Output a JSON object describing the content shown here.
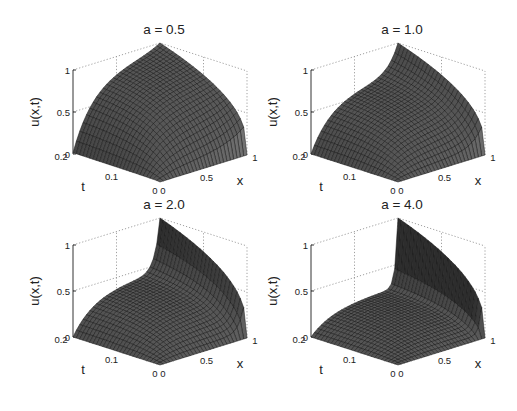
{
  "chart_data": [
    {
      "type": "surface",
      "title": "a = 0.5",
      "a": 0.5,
      "xlabel": "x",
      "ylabel": "t",
      "zlabel": "u(x,t)",
      "x_ticks": [
        "0",
        "0.5",
        "1"
      ],
      "t_ticks": [
        "0",
        "0.1",
        "0.2"
      ],
      "z_ticks": [
        "0",
        "0.5",
        "1"
      ],
      "xlim": [
        0,
        1
      ],
      "tlim": [
        0,
        0.2
      ],
      "zlim": [
        0,
        1
      ],
      "grid": true,
      "plateau_at_t_max": 0.85,
      "peak_at_x1": 1.0
    },
    {
      "type": "surface",
      "title": "a = 1.0",
      "a": 1.0,
      "xlabel": "x",
      "ylabel": "t",
      "zlabel": "u(x,t)",
      "x_ticks": [
        "0",
        "0.5",
        "1"
      ],
      "t_ticks": [
        "0",
        "0.1",
        "0.2"
      ],
      "z_ticks": [
        "0",
        "0.5",
        "1"
      ],
      "xlim": [
        0,
        1
      ],
      "tlim": [
        0,
        0.2
      ],
      "zlim": [
        0,
        1
      ],
      "grid": true,
      "plateau_at_t_max": 0.62,
      "peak_at_x1": 1.0
    },
    {
      "type": "surface",
      "title": "a = 2.0",
      "a": 2.0,
      "xlabel": "x",
      "ylabel": "t",
      "zlabel": "u(x,t)",
      "x_ticks": [
        "0",
        "0.5",
        "1"
      ],
      "t_ticks": [
        "0",
        "0.1",
        "0.2"
      ],
      "z_ticks": [
        "0",
        "0.5",
        "1"
      ],
      "xlim": [
        0,
        1
      ],
      "tlim": [
        0,
        0.2
      ],
      "zlim": [
        0,
        1
      ],
      "grid": true,
      "plateau_at_t_max": 0.42,
      "peak_at_x1": 1.0
    },
    {
      "type": "surface",
      "title": "a = 4.0",
      "a": 4.0,
      "xlabel": "x",
      "ylabel": "t",
      "zlabel": "u(x,t)",
      "x_ticks": [
        "0",
        "0.5",
        "1"
      ],
      "t_ticks": [
        "0",
        "0.1",
        "0.2"
      ],
      "z_ticks": [
        "0",
        "0.5",
        "1"
      ],
      "xlim": [
        0,
        1
      ],
      "tlim": [
        0,
        0.2
      ],
      "zlim": [
        0,
        1
      ],
      "grid": true,
      "plateau_at_t_max": 0.25,
      "peak_at_x1": 1.0
    }
  ],
  "layout": {
    "panels": [
      {
        "ox": 0,
        "oy": 0
      },
      {
        "ox": 238,
        "oy": 0
      },
      {
        "ox": 0,
        "oy": 182
      },
      {
        "ox": 238,
        "oy": 182
      }
    ],
    "colors": {
      "surface_dark": "#4a4a4a",
      "surface_light": "#8a8a8a",
      "mesh": "#151515",
      "grid": "#888888"
    }
  }
}
